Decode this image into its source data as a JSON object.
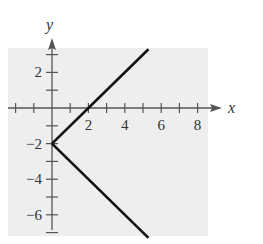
{
  "chart_data": {
    "type": "line",
    "title": "",
    "relation": "x = |y + 2|",
    "xlabel": "x",
    "ylabel": "y",
    "xlim": [
      -2.5,
      8.5
    ],
    "ylim": [
      -7.3,
      3.3
    ],
    "x_ticks": [
      -2,
      -1,
      0,
      1,
      2,
      3,
      4,
      5,
      6,
      7,
      8
    ],
    "x_tick_labels": [
      "2",
      "4",
      "6",
      "8"
    ],
    "y_ticks": [
      3,
      2,
      1,
      0,
      -1,
      -2,
      -3,
      -4,
      -5,
      -6,
      -7
    ],
    "y_tick_labels": [
      "2",
      "−2",
      "−4",
      "−6"
    ],
    "grid": false,
    "background": "#eeeeee",
    "line_color": "#111111",
    "series": [
      {
        "name": "upper branch",
        "points": [
          [
            0,
            -2
          ],
          [
            5.3,
            3.3
          ]
        ]
      },
      {
        "name": "lower branch",
        "points": [
          [
            0,
            -2
          ],
          [
            5.3,
            -7.3
          ]
        ]
      }
    ],
    "vertex": [
      0,
      -2
    ]
  }
}
